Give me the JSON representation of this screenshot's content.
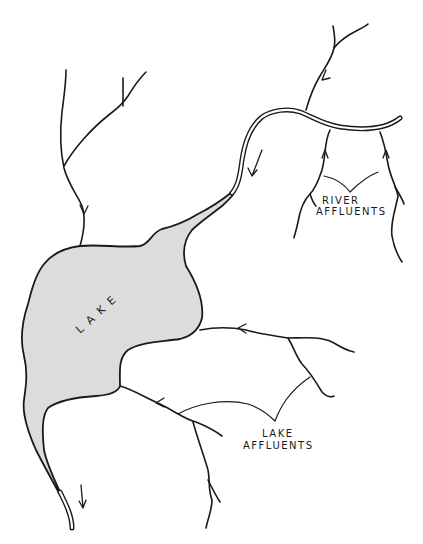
{
  "diagram": {
    "colors": {
      "lake_fill": "#dcdcdc",
      "ink": "#1a1a1a",
      "background": "#ffffff"
    },
    "labels": {
      "lake": "LAKE",
      "river_affluents": [
        "RIVER",
        "AFFLUENTS"
      ],
      "lake_affluents": [
        "LAKE",
        "AFFLUENTS"
      ]
    },
    "elements": [
      {
        "id": "lake",
        "kind": "water-body",
        "label": "LAKE"
      },
      {
        "id": "main-river",
        "kind": "river",
        "flow": "into lake"
      },
      {
        "id": "river-affluents",
        "kind": "tributary-group",
        "label": "RIVER AFFLUENTS",
        "flows_into": "main-river"
      },
      {
        "id": "lake-affluents",
        "kind": "tributary-group",
        "label": "LAKE AFFLUENTS",
        "flows_into": "lake"
      },
      {
        "id": "north-inflow",
        "kind": "stream",
        "flows_into": "lake"
      },
      {
        "id": "outflow",
        "kind": "river",
        "flow": "out of lake"
      }
    ]
  }
}
